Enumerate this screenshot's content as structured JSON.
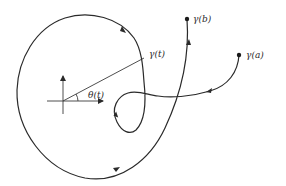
{
  "figure": {
    "labels": {
      "gamma_b": "γ(b)",
      "gamma_a": "γ(a)",
      "gamma_t": "γ(t)",
      "theta_t": "θ(t)"
    },
    "colors": {
      "stroke": "#2a2a2a",
      "background": "#ffffff"
    }
  }
}
